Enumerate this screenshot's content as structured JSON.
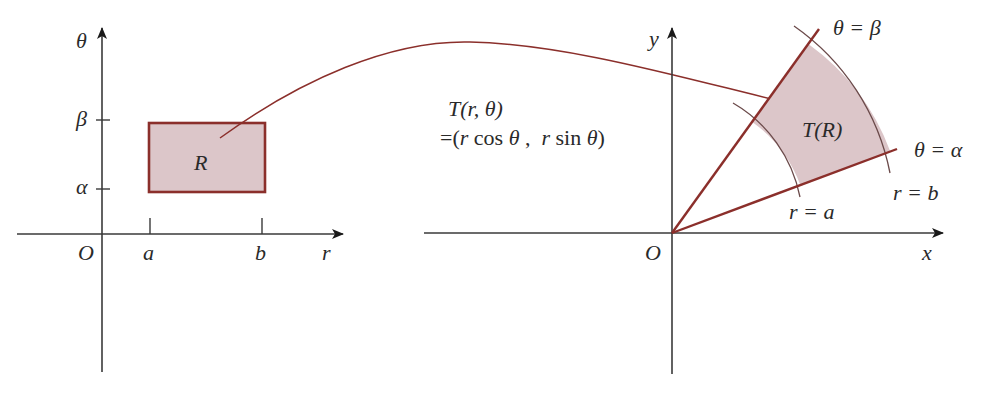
{
  "figure": {
    "colors": {
      "region_fill": "#dcc6c9",
      "region_stroke": "#8b2f2b",
      "axis": "#3a3a3a",
      "arc": "#6b4a4a",
      "text": "#2a2a2a"
    }
  },
  "left_panel": {
    "vertical_axis_label": "θ",
    "horizontal_axis_label": "r",
    "origin_label": "O",
    "theta_ticks": [
      {
        "label": "β",
        "position": "upper"
      },
      {
        "label": "α",
        "position": "lower"
      }
    ],
    "r_ticks": [
      {
        "label": "a"
      },
      {
        "label": "b"
      }
    ],
    "region_label": "R"
  },
  "transform": {
    "line1": "T(r, θ)",
    "line2_prefix": "=(",
    "line2_r1": "r",
    "line2_cos": " cos ",
    "line2_theta1": "θ",
    "line2_sep": " ,  ",
    "line2_r2": "r",
    "line2_sin": " sin ",
    "line2_theta2": "θ",
    "line2_suffix": ")"
  },
  "right_panel": {
    "vertical_axis_label": "y",
    "horizontal_axis_label": "x",
    "origin_label": "O",
    "region_label": "T(R)",
    "ray_beta_label": "θ = β",
    "ray_alpha_label": "θ = α",
    "arc_inner_label": "r = a",
    "arc_outer_label": "r = b"
  }
}
